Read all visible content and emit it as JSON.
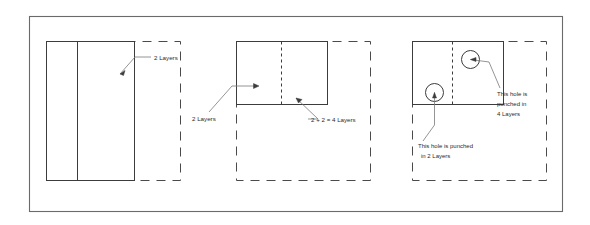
{
  "figure": {
    "border_color": "#5a5a5a",
    "line_color": "#3c3c3c",
    "dash_color": "#4a4a4a",
    "text_color": "#2b2b2b",
    "background": "#ffffff"
  },
  "panels": [
    {
      "id": "panel-1",
      "name": "two-layers-flat",
      "annotations": [
        {
          "id": "ann-1",
          "text": "2 Layers",
          "lines": [
            "2 Layers"
          ]
        }
      ],
      "holes": []
    },
    {
      "id": "panel-2",
      "name": "folded-four-layers",
      "annotations": [
        {
          "id": "ann-2",
          "text": "2 Layers",
          "lines": [
            "2 Layers"
          ]
        },
        {
          "id": "ann-3",
          "text": "2 + 2 = 4 Layers",
          "lines": [
            "2 + 2 = 4 Layers"
          ]
        }
      ],
      "holes": []
    },
    {
      "id": "panel-3",
      "name": "punched-holes",
      "annotations": [
        {
          "id": "ann-4",
          "text": "This hole is punched in 4 Layers",
          "lines": [
            "This hole is",
            "punched  in",
            "4 Layers"
          ]
        },
        {
          "id": "ann-5",
          "text": "This hole is punched in 2 Layers",
          "lines": [
            "This hole is punched",
            "in 2 Layers"
          ]
        }
      ],
      "holes": [
        {
          "id": "hole-upper",
          "label": "hole punched in 4 layers"
        },
        {
          "id": "hole-lower",
          "label": "hole punched in 2 layers"
        }
      ]
    }
  ],
  "labels": {
    "p1_layers": "2 Layers",
    "p2_layers": "2 Layers",
    "p2_sum": "2 + 2 = 4 Layers",
    "p3_four_l1": "This hole is",
    "p3_four_l2": "punched  in",
    "p3_four_l3": "4 Layers",
    "p3_two_l1": "This hole is punched",
    "p3_two_l2": "in 2 Layers"
  }
}
